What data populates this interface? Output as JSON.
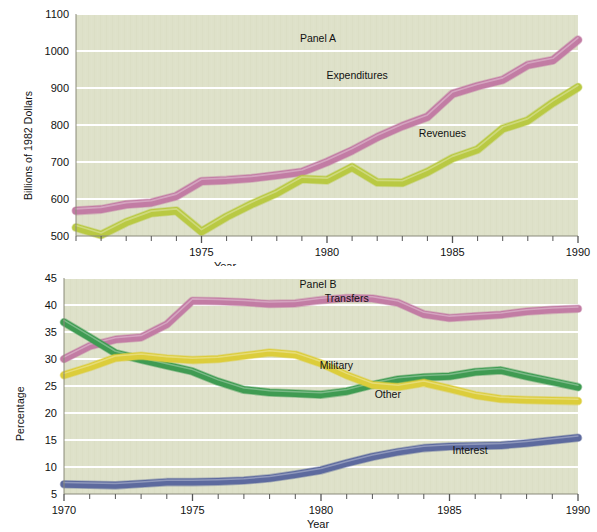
{
  "figure": {
    "background": "#ffffff",
    "plot_background": "#dee1c9",
    "gridline_color": "#ffffff",
    "axis_color": "#8a8a7a"
  },
  "chart_data": [
    {
      "type": "line",
      "id": "panel-a",
      "title": "Panel A",
      "xlabel": "Year",
      "ylabel": "Billions of 1982 Dollars",
      "xlim": [
        1970,
        1990
      ],
      "ylim": [
        500,
        1100
      ],
      "xticks": [
        1975,
        1980,
        1985,
        1990
      ],
      "xtick_labels": [
        "1975",
        "1980",
        "1985",
        "1990"
      ],
      "yticks": [
        500,
        600,
        700,
        800,
        900,
        1000,
        1100
      ],
      "ytick_labels": [
        "500",
        "600",
        "700",
        "800",
        "900",
        "1000",
        "1100"
      ],
      "minor_xtick_interval": 1,
      "grid": "horizontal",
      "legend_position": "inline-annotation",
      "x": [
        1970,
        1971,
        1972,
        1973,
        1974,
        1975,
        1976,
        1977,
        1978,
        1979,
        1980,
        1981,
        1982,
        1983,
        1984,
        1985,
        1986,
        1987,
        1988,
        1989,
        1990
      ],
      "series": [
        {
          "name": "Expenditures",
          "color": "#c27ca4",
          "label_x": 1981.2,
          "label_y": 935,
          "values": [
            568,
            572,
            585,
            590,
            608,
            648,
            651,
            656,
            664,
            673,
            700,
            731,
            767,
            797,
            822,
            884,
            905,
            922,
            962,
            975,
            1030
          ]
        },
        {
          "name": "Revenues",
          "color": "#b9c943",
          "label_x": 1984.6,
          "label_y": 778,
          "values": [
            523,
            503,
            537,
            562,
            568,
            512,
            552,
            586,
            616,
            654,
            651,
            686,
            645,
            644,
            673,
            710,
            734,
            790,
            812,
            860,
            902
          ]
        }
      ]
    },
    {
      "type": "line",
      "id": "panel-b",
      "title": "Panel B",
      "xlabel": "Year",
      "ylabel": "Percentage",
      "xlim": [
        1970,
        1990
      ],
      "ylim": [
        5,
        45
      ],
      "xticks": [
        1970,
        1975,
        1980,
        1985,
        1990
      ],
      "xtick_labels": [
        "1970",
        "1975",
        "1980",
        "1985",
        "1990"
      ],
      "yticks": [
        5,
        10,
        15,
        20,
        25,
        30,
        35,
        40,
        45
      ],
      "ytick_labels": [
        "5",
        "10",
        "15",
        "20",
        "25",
        "30",
        "35",
        "40",
        "45"
      ],
      "minor_xtick_interval": 1,
      "grid": "horizontal",
      "legend_position": "inline-annotation",
      "x": [
        1970,
        1971,
        1972,
        1973,
        1974,
        1975,
        1976,
        1977,
        1978,
        1979,
        1980,
        1981,
        1982,
        1983,
        1984,
        1985,
        1986,
        1987,
        1988,
        1989,
        1990
      ],
      "series": [
        {
          "name": "Transfers",
          "color": "#c27ca4",
          "label_x": 1981.0,
          "label_y": 41.3,
          "values": [
            30.0,
            32.4,
            33.6,
            34.0,
            36.4,
            40.8,
            40.7,
            40.5,
            40.2,
            40.3,
            40.9,
            41.3,
            41.2,
            40.4,
            38.3,
            37.6,
            37.9,
            38.2,
            38.8,
            39.1,
            39.3
          ]
        },
        {
          "name": "Military",
          "color": "#3f9b52",
          "label_x": 1980.6,
          "label_y": 28.9,
          "values": [
            36.8,
            34.0,
            31.1,
            29.9,
            28.8,
            27.7,
            25.8,
            24.3,
            23.8,
            23.6,
            23.4,
            24.0,
            25.2,
            26.2,
            26.6,
            26.8,
            27.6,
            27.9,
            26.8,
            25.8,
            24.8
          ]
        },
        {
          "name": "Other",
          "color": "#dccd3b",
          "label_x": 1982.6,
          "label_y": 23.6,
          "values": [
            27.0,
            28.5,
            30.2,
            30.6,
            30.1,
            29.8,
            30.0,
            30.6,
            31.2,
            30.8,
            29.2,
            27.0,
            25.2,
            24.8,
            25.6,
            24.5,
            23.3,
            22.6,
            22.4,
            22.3,
            22.2
          ]
        },
        {
          "name": "Interest",
          "color": "#5d6a9e",
          "label_x": 1985.8,
          "label_y": 13.2,
          "values": [
            6.8,
            6.7,
            6.6,
            6.9,
            7.2,
            7.2,
            7.3,
            7.5,
            7.9,
            8.6,
            9.4,
            10.7,
            11.9,
            12.8,
            13.5,
            13.8,
            13.9,
            14.0,
            14.4,
            14.9,
            15.4
          ]
        }
      ]
    }
  ]
}
